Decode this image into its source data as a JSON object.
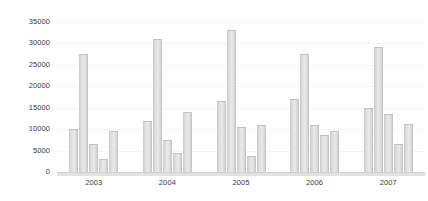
{
  "chart_data": {
    "type": "bar",
    "title": "",
    "subtitle": "",
    "xlabel": "",
    "ylabel": "",
    "categories": [
      "2003",
      "2004",
      "2005",
      "2006",
      "2007"
    ],
    "series": [
      {
        "name": "Series 1",
        "values": [
          10000,
          11800,
          16500,
          17000,
          15000
        ]
      },
      {
        "name": "Series 2",
        "values": [
          27500,
          31000,
          33000,
          27500,
          29000
        ]
      },
      {
        "name": "Series 3",
        "values": [
          6500,
          7500,
          10500,
          11000,
          13500
        ]
      },
      {
        "name": "Series 4",
        "values": [
          3000,
          4500,
          3800,
          8500,
          6500
        ]
      },
      {
        "name": "Series 5",
        "values": [
          9500,
          14000,
          11000,
          9500,
          11200
        ]
      }
    ],
    "ylim": [
      0,
      35000
    ],
    "ytick_labels": [
      "0",
      "5000",
      "10000",
      "15000",
      "20000",
      "25000",
      "30000",
      "35000"
    ],
    "ytick_values": [
      0,
      5000,
      10000,
      15000,
      20000,
      25000,
      30000,
      35000
    ],
    "grid": true,
    "legend": false,
    "legend_position": "none",
    "bar_color": "#dcdcdc",
    "bar_edge_color": "#bdbdbd",
    "axis_color": "#cfcfcf",
    "text_color": "#3a3a3a",
    "background_color": "#ffffff"
  }
}
